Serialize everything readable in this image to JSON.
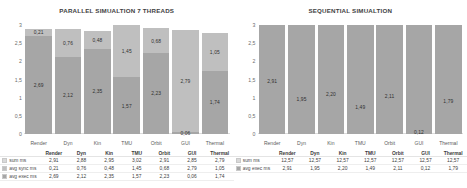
{
  "charts": [
    {
      "title": "PARALLEL SIMUALTION 7 THREADS",
      "categories": [
        "Render",
        "Dyn",
        "Kin",
        "TMU",
        "Orbit",
        "GUI",
        "Thermal"
      ],
      "yticks": [
        "3",
        "2,5",
        "2",
        "1,5",
        "1",
        "0,5",
        "0"
      ],
      "ymax": 3,
      "rows": [
        {
          "label": "sum ms",
          "swatch": "sw-sum",
          "values": [
            "2,91",
            "2,88",
            "2,95",
            "3,02",
            "2,91",
            "2,85",
            "2,79"
          ]
        },
        {
          "label": "avg sync ms",
          "swatch": "sw-sync",
          "values": [
            "0,21",
            "0,76",
            "0,48",
            "1,45",
            "0,68",
            "2,79",
            "1,05"
          ]
        },
        {
          "label": "avg exec ms",
          "swatch": "sw-exec",
          "values": [
            "2,69",
            "2,12",
            "2,35",
            "1,57",
            "2,23",
            "0,06",
            "1,74"
          ]
        }
      ]
    },
    {
      "title": "SEQUENTIAL SIMUALTION",
      "categories": [
        "Render",
        "Dyn",
        "Kin",
        "TMU",
        "Orbit",
        "GUI",
        "Thermal"
      ],
      "yticks": [
        "3",
        "2,5",
        "2",
        "1,5",
        "1",
        "0,5",
        "0"
      ],
      "ymax": 3,
      "rows": [
        {
          "label": "sum ms",
          "swatch": "sw-sum",
          "values": [
            "12,57",
            "12,57",
            "12,57",
            "12,57",
            "12,57",
            "12,57",
            "12,57"
          ]
        },
        {
          "label": "avg exec ms",
          "swatch": "sw-exec",
          "values": [
            "2,91",
            "1,95",
            "2,20",
            "1,49",
            "2,11",
            "0,12",
            "1,79"
          ]
        }
      ]
    }
  ],
  "chart_data": [
    {
      "type": "bar",
      "stacked": true,
      "title": "PARALLEL SIMUALTION 7 THREADS",
      "xlabel": "",
      "ylabel": "",
      "ylim": [
        0,
        3
      ],
      "yticks": [
        0,
        0.5,
        1,
        1.5,
        2,
        2.5,
        3
      ],
      "grid": false,
      "legend": "bottom-table",
      "categories": [
        "Render",
        "Dyn",
        "Kin",
        "TMU",
        "Orbit",
        "GUI",
        "Thermal"
      ],
      "series": [
        {
          "name": "avg exec ms",
          "values": [
            2.69,
            2.12,
            2.35,
            1.57,
            2.23,
            0.06,
            1.74
          ]
        },
        {
          "name": "avg sync ms",
          "values": [
            0.21,
            0.76,
            0.48,
            1.45,
            0.68,
            2.79,
            1.05
          ]
        }
      ],
      "totals": {
        "name": "sum ms",
        "values": [
          2.91,
          2.88,
          2.95,
          3.02,
          2.91,
          2.85,
          2.79
        ]
      }
    },
    {
      "type": "bar",
      "stacked": true,
      "title": "SEQUENTIAL SIMUALTION",
      "xlabel": "",
      "ylabel": "",
      "ylim": [
        0,
        3
      ],
      "yticks": [
        0,
        0.5,
        1,
        1.5,
        2,
        2.5,
        3
      ],
      "grid": false,
      "legend": "bottom-table",
      "categories": [
        "Render",
        "Dyn",
        "Kin",
        "TMU",
        "Orbit",
        "GUI",
        "Thermal"
      ],
      "series": [
        {
          "name": "avg exec ms",
          "values": [
            2.91,
            1.95,
            2.2,
            1.49,
            2.11,
            0.12,
            1.79
          ]
        }
      ],
      "totals": {
        "name": "sum ms",
        "values": [
          12.57,
          12.57,
          12.57,
          12.57,
          12.57,
          12.57,
          12.57
        ]
      }
    }
  ]
}
